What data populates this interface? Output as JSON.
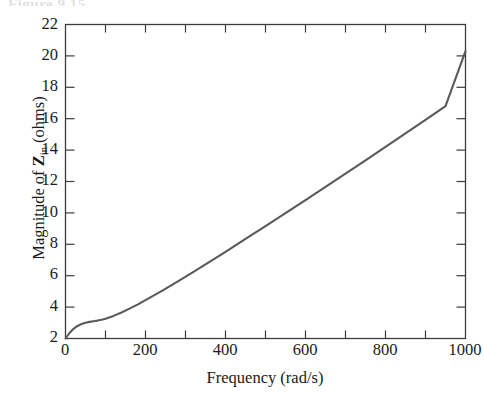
{
  "figure": {
    "top_caption_fragment": "Figure 9.15",
    "axis_color": "#3c3c3c",
    "curve_color": "#5a5a5a",
    "background": "#ffffff"
  },
  "chart_data": {
    "type": "line",
    "title": "",
    "xlabel": "Frequency (rad/s)",
    "ylabel_plain": "Magnitude of Zin (ohms)",
    "ylabel_parts": {
      "prefix": "Magnitude of ",
      "symbol": "Z",
      "subscript": "in",
      "suffix": " (ohms)"
    },
    "xlim": [
      0,
      1000
    ],
    "ylim": [
      2,
      22
    ],
    "xticks": [
      0,
      200,
      400,
      600,
      800,
      1000
    ],
    "xtick_labels": [
      "0",
      "200",
      "400",
      "600",
      "800",
      "1000"
    ],
    "x_minor_ticks": [
      100,
      300,
      500,
      700,
      900
    ],
    "yticks": [
      2,
      4,
      6,
      8,
      10,
      12,
      14,
      16,
      18,
      20,
      22
    ],
    "ytick_labels": [
      "2",
      "4",
      "6",
      "8",
      "10",
      "12",
      "14",
      "16",
      "18",
      "20",
      "22"
    ],
    "grid": false,
    "legend": null,
    "ticks_direction": "in",
    "box_frame": true,
    "series": [
      {
        "name": "Magnitude of Zin",
        "x": [
          0,
          10,
          20,
          30,
          40,
          50,
          60,
          70,
          80,
          90,
          100,
          120,
          140,
          160,
          180,
          200,
          240,
          280,
          320,
          360,
          400,
          450,
          500,
          550,
          600,
          650,
          700,
          750,
          800,
          850,
          900,
          950,
          1000
        ],
        "y": [
          2.0,
          2.35,
          2.62,
          2.8,
          2.92,
          3.0,
          3.06,
          3.1,
          3.14,
          3.2,
          3.26,
          3.44,
          3.66,
          3.9,
          4.16,
          4.44,
          5.02,
          5.62,
          6.24,
          6.88,
          7.52,
          8.34,
          9.16,
          9.99,
          10.82,
          11.66,
          12.5,
          13.34,
          14.2,
          15.06,
          15.93,
          16.8,
          20.3
        ]
      }
    ],
    "annotations": []
  }
}
